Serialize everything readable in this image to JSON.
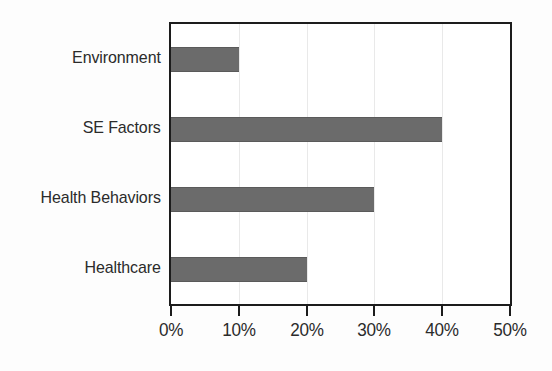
{
  "chart_data": {
    "type": "bar",
    "orientation": "horizontal",
    "title": "",
    "subtitle": "",
    "xlabel": "",
    "ylabel": "",
    "categories": [
      "Environment",
      "SE Factors",
      "Health Behaviors",
      "Healthcare"
    ],
    "values": [
      10,
      40,
      30,
      20
    ],
    "value_labels": [
      "10%",
      "40%",
      "30%",
      "20%"
    ],
    "xlim": [
      0,
      50
    ],
    "ylim": null,
    "xticks": [
      0,
      10,
      20,
      30,
      40,
      50
    ],
    "xtick_labels": [
      "0%",
      "10%",
      "20%",
      "30%",
      "40%",
      "50%"
    ],
    "grid": true,
    "grid_axis": "x",
    "legend": false,
    "legend_position": "none",
    "series": [
      {
        "name": "",
        "values": [
          10,
          40,
          30,
          20
        ],
        "color": "#6b6b6b"
      }
    ],
    "annotations": [],
    "colors": {
      "bar": "#6b6b6b",
      "bar_edge": "#5a5a5a",
      "axis": "#1c1c1c",
      "grid": "#e9e9e9",
      "text": "#2b2b2b",
      "background": "#fdfdfd",
      "plot_background": "#ffffff"
    }
  },
  "axis": {
    "x_tick_labels": [
      "0%",
      "10%",
      "20%",
      "30%",
      "40%",
      "50%"
    ],
    "y_tick_labels": [
      "Environment",
      "SE Factors",
      "Health Behaviors",
      "Healthcare"
    ]
  },
  "bars": [
    {
      "label": "Environment",
      "value": 10,
      "value_label": "10%"
    },
    {
      "label": "SE Factors",
      "value": 40,
      "value_label": "40%"
    },
    {
      "label": "Health Behaviors",
      "value": 30,
      "value_label": "30%"
    },
    {
      "label": "Healthcare",
      "value": 20,
      "value_label": "20%"
    }
  ]
}
